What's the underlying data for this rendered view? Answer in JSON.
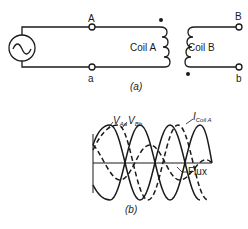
{
  "circuit": {
    "terminals": {
      "A": "A",
      "a": "a",
      "B": "B",
      "b": "b"
    },
    "coil_a_label": "Coil A",
    "coil_b_label": "Coil B",
    "caption": "(a)",
    "source_icon": "ac-source-icon"
  },
  "waveforms": {
    "caption": "(b)",
    "labels": {
      "v_aa_main": "V",
      "v_aa_sub": "Aa",
      "v_bb_main": "V",
      "v_bb_sub": "Bb",
      "i_coil_main": "I",
      "i_coil_sub": "Coil A",
      "flux": "Flux"
    }
  },
  "colors": {
    "ink": "#1a1a1a",
    "background": "#ffffff"
  }
}
